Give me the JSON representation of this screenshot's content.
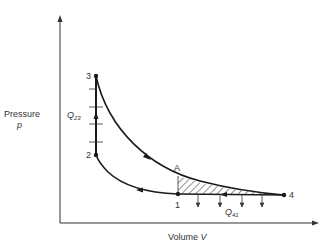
{
  "diagram": {
    "type": "p-V diagram (Otto-like cycle with constant-volume heat addition)",
    "axes": {
      "y_label": "Pressure",
      "y_symbol": "p",
      "x_label": "Volume",
      "x_symbol": "V"
    },
    "points": [
      {
        "id": "1",
        "label": "1"
      },
      {
        "id": "2",
        "label": "2"
      },
      {
        "id": "3",
        "label": "3"
      },
      {
        "id": "4",
        "label": "4"
      },
      {
        "id": "A",
        "label": "A"
      }
    ],
    "heat_labels": {
      "q23": {
        "letter": "Q",
        "sub": "23"
      },
      "q41": {
        "letter": "Q",
        "sub": "41"
      }
    },
    "processes": [
      {
        "from": "2",
        "to": "3",
        "kind": "constant volume heat addition",
        "direction": "up"
      },
      {
        "from": "3",
        "to": "4",
        "kind": "expansion curve",
        "direction": "down-right"
      },
      {
        "from": "4",
        "to": "1",
        "kind": "constant pressure heat rejection",
        "direction": "left"
      },
      {
        "from": "1",
        "to": "2",
        "kind": "compression curve",
        "direction": "up-left"
      }
    ],
    "hatched_region": "area between curve A-4 and line 1-4",
    "colors": {
      "line": "#1a1a1a",
      "text": "#333333",
      "background": "#ffffff"
    }
  }
}
